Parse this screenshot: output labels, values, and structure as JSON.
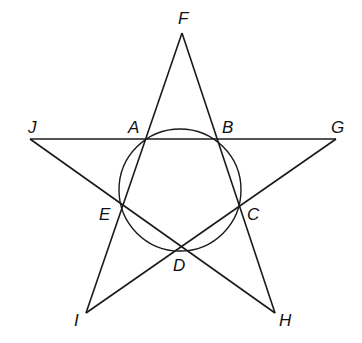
{
  "diagram": {
    "type": "geometry-figure",
    "points": {
      "F": {
        "label": "F",
        "x": 182,
        "y": 33
      },
      "J": {
        "label": "J",
        "x": 30,
        "y": 139
      },
      "G": {
        "label": "G",
        "x": 336,
        "y": 139
      },
      "I": {
        "label": "I",
        "x": 86,
        "y": 313
      },
      "H": {
        "label": "H",
        "x": 275,
        "y": 313
      },
      "A": {
        "label": "A",
        "x": 146,
        "y": 139
      },
      "B": {
        "label": "B",
        "x": 218,
        "y": 139
      },
      "C": {
        "label": "C",
        "x": 240,
        "y": 204
      },
      "D": {
        "label": "D",
        "x": 182,
        "y": 247
      },
      "E": {
        "label": "E",
        "x": 122,
        "y": 204
      }
    },
    "segments": [
      [
        "J",
        "G"
      ],
      [
        "F",
        "I"
      ],
      [
        "F",
        "H"
      ],
      [
        "J",
        "H"
      ],
      [
        "G",
        "I"
      ]
    ],
    "circle": {
      "through": [
        "A",
        "B",
        "C",
        "D",
        "E"
      ],
      "cx": 180,
      "cy": 190,
      "r": 61
    },
    "labels": {
      "F": "F",
      "J": "J",
      "A": "A",
      "B": "B",
      "G": "G",
      "E": "E",
      "C": "C",
      "D": "D",
      "I": "I",
      "H": "H"
    },
    "colors": {
      "stroke": "#1a1a1a",
      "background": "#ffffff"
    }
  }
}
